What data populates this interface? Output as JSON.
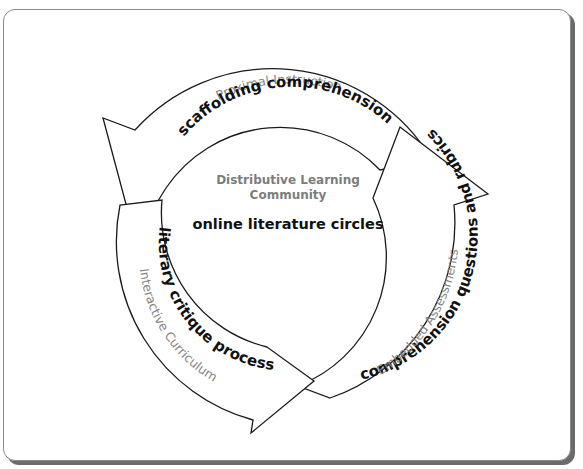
{
  "diagram": {
    "center": {
      "subtitle": "Distributive Learning Community",
      "title": "online literature circles"
    },
    "cycle": [
      {
        "label": "scaffolding comprehension",
        "sublabel": "Proximal Instruction",
        "position": "top"
      },
      {
        "label": "comprehension questions and rubrics",
        "sublabel": "Embedded Assessments",
        "position": "right"
      },
      {
        "label": "literary critique process",
        "sublabel": "Interactive Curriculum",
        "position": "left"
      }
    ],
    "colors": {
      "stroke": "#1a1a1a",
      "main_text": "#111111",
      "sub_text": "#858585",
      "frame_border": "#8a8a8a",
      "frame_shadow": "#6b6b6b"
    }
  }
}
